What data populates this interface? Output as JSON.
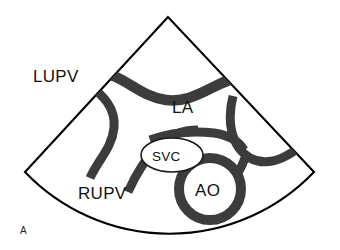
{
  "figure": {
    "panel_label": "A",
    "modality": "echocardiogram-sector-schematic",
    "background_color": "#ffffff",
    "outline_color": "#000000",
    "vessel_color": "#3c3c3c",
    "text_color": "#111111"
  },
  "labels": {
    "lupv": "LUPV",
    "rupv": "RUPV",
    "la": "LA",
    "svc": "SVC",
    "ao": "AO"
  },
  "structures": [
    {
      "id": "lupv",
      "name": "left-upper-pulmonary-vein",
      "label": "LUPV",
      "label_x": 33,
      "label_y": 82,
      "inside_sector": false
    },
    {
      "id": "rupv",
      "name": "right-upper-pulmonary-vein",
      "label": "RUPV",
      "label_x": 78,
      "label_y": 199,
      "inside_sector": true
    },
    {
      "id": "la",
      "name": "left-atrium",
      "label": "LA",
      "label_x": 172,
      "label_y": 113,
      "inside_sector": true
    },
    {
      "id": "svc",
      "name": "superior-vena-cava",
      "label": "SVC",
      "label_x": 160,
      "label_y": 161,
      "inside_sector": true
    },
    {
      "id": "ao",
      "name": "aorta",
      "label": "AO",
      "label_x": 197,
      "label_y": 194,
      "inside_sector": true
    }
  ],
  "sector": {
    "apex_x": 168,
    "apex_y": 17,
    "left_corner_x": 25,
    "left_corner_y": 172,
    "right_corner_x": 314,
    "right_corner_y": 172,
    "arc_bottom_y": 240
  }
}
